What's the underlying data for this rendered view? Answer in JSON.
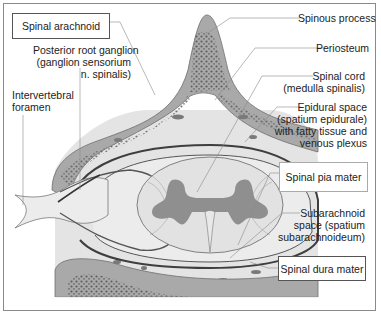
{
  "diagram": {
    "type": "anatomical cross-section",
    "colors": {
      "bone": "#a9a9a9",
      "bone_outline": "#6e6e6e",
      "soft_tissue": "#e6e6e6",
      "cord": "#e2e2e2",
      "gray_matter": "#8f8f8f",
      "dura": "#3e3e3e",
      "leader_line": "#8a8a8a"
    },
    "labels": {
      "spinal_arachnoid": "Spinal arachnoid",
      "posterior_root_ganglion": [
        "Posterior root ganglion",
        "(ganglion sensorium",
        "n. spinalis)"
      ],
      "intervertebral_foramen": [
        "Intervertebral",
        "foramen"
      ],
      "spinous_process": "Spinous process",
      "periosteum": "Periosteum",
      "spinal_cord": [
        "Spinal cord",
        "(medulla spinalis)"
      ],
      "epidural_space": [
        "Epidural space",
        "(spatium epidurale)",
        "with fatty tissue and",
        "venous plexus"
      ],
      "spinal_pia_mater": "Spinal pia mater",
      "subarachnoid_space": [
        "Subarachnoid",
        "space (spatium",
        "subarachnoideum)"
      ],
      "spinal_dura_mater": "Spinal dura mater"
    }
  }
}
